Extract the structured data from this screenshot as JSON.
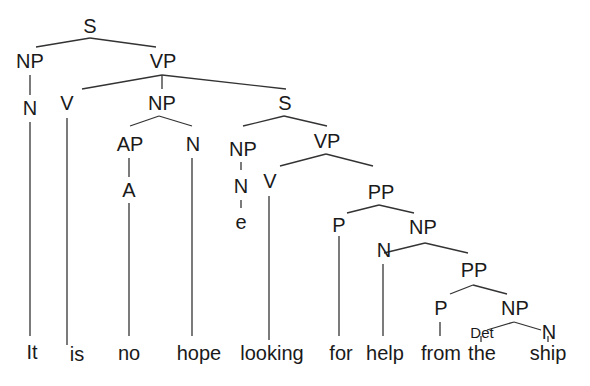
{
  "diagram": {
    "type": "syntax-tree",
    "sentence": [
      "It",
      "is",
      "no",
      "hope",
      "looking",
      "for",
      "help",
      "from",
      "the",
      "ship"
    ],
    "nodes": {
      "s_root": "S",
      "np_subj": "NP",
      "vp_main": "VP",
      "n_it": "N",
      "v_is": "V",
      "np_obj": "NP",
      "s_embedded": "S",
      "ap": "AP",
      "n_hope": "N",
      "np_empty": "NP",
      "vp_embedded": "VP",
      "a_no": "A",
      "n_empty": "N",
      "e": "e",
      "v_looking": "V",
      "pp_for": "PP",
      "p_for": "P",
      "np_help": "NP",
      "n_help": "N",
      "pp_from": "PP",
      "p_from": "P",
      "np_ship": "NP",
      "det_the": "Det",
      "n_ship": "N"
    },
    "words": {
      "w0": "It",
      "w1": "is",
      "w2": "no",
      "w3": "hope",
      "w4": "looking",
      "w5": "for",
      "w6": "help",
      "w7": "from",
      "w8": "the",
      "w9": "ship"
    },
    "structure": "[S [NP [N It]] [VP [V is] [NP [AP [A no]] [N hope]] [S [NP [N e]] [VP [V looking] [PP [P for] [NP [N help] [PP [P from] [NP [Det the] [N ship]]]]]]]]]"
  }
}
